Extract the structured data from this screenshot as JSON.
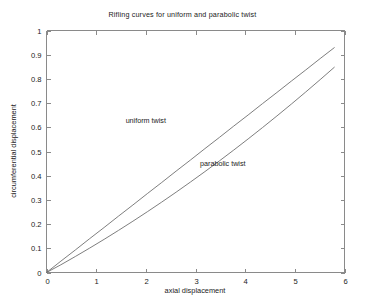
{
  "chart_data": {
    "type": "line",
    "title": "Rifling curves for uniform and parabolic twist",
    "xlabel": "axial displacement",
    "ylabel": "circumferential displacement",
    "xlim": [
      0,
      6
    ],
    "ylim": [
      0,
      1
    ],
    "grid": false,
    "legend": "in-plot annotations",
    "xticks": [
      "0",
      "1",
      "2",
      "3",
      "4",
      "5",
      "6"
    ],
    "xtick_values": [
      0,
      1,
      2,
      3,
      4,
      5,
      6
    ],
    "yticks": [
      "0",
      "0.1",
      "0.2",
      "0.3",
      "0.4",
      "0.5",
      "0.6",
      "0.7",
      "0.8",
      "0.9",
      "1"
    ],
    "ytick_values": [
      0,
      0.1,
      0.2,
      0.3,
      0.4,
      0.5,
      0.6,
      0.7,
      0.8,
      0.9,
      1
    ],
    "x": [
      0,
      0.29,
      0.58,
      0.87,
      1.16,
      1.45,
      1.74,
      2.03,
      2.32,
      2.61,
      2.9,
      3.19,
      3.48,
      3.77,
      4.06,
      4.35,
      4.64,
      4.93,
      5.22,
      5.51,
      5.8
    ],
    "series": [
      {
        "name": "uniform twist",
        "label": "uniform twist",
        "color": "#6f6f6f",
        "values": [
          0,
          0.047,
          0.093,
          0.14,
          0.186,
          0.233,
          0.279,
          0.326,
          0.372,
          0.419,
          0.465,
          0.512,
          0.558,
          0.605,
          0.651,
          0.698,
          0.744,
          0.791,
          0.837,
          0.884,
          0.93
        ]
      },
      {
        "name": "parabolic twist",
        "label": "parabolic twist",
        "color": "#8a8a8a",
        "values": [
          0,
          0.032,
          0.066,
          0.101,
          0.137,
          0.174,
          0.212,
          0.251,
          0.291,
          0.332,
          0.374,
          0.417,
          0.461,
          0.506,
          0.552,
          0.599,
          0.647,
          0.696,
          0.746,
          0.797,
          0.849
        ]
      }
    ],
    "annotations": [
      {
        "text": "uniform twist",
        "x": 2.0,
        "y": 0.62
      },
      {
        "text": "parabolic twist",
        "x": 3.55,
        "y": 0.44
      }
    ]
  }
}
